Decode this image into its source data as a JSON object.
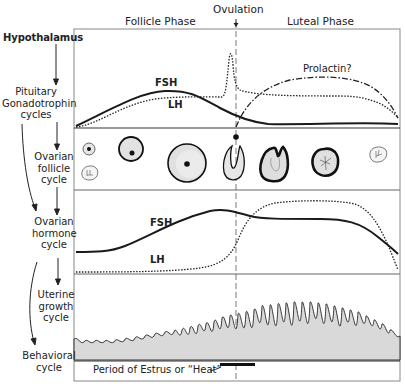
{
  "header": {
    "ovulation": "Ovulation",
    "follicle_phase": "Follicle Phase",
    "luteal_phase": "Luteal Phase"
  },
  "rows": {
    "hypothalamus": "Hypothalamus",
    "pituitary": [
      "Pituitary",
      "Gonadotrophin",
      "cycles"
    ],
    "ovarian_follicle": [
      "Ovarian",
      "follicle",
      "cycle"
    ],
    "ovarian_hormone": [
      "Ovarian",
      "hormone",
      "cycle"
    ],
    "uterine": [
      "Uterine",
      "growth",
      "cycle"
    ],
    "behavioral": [
      "Behavioral",
      "cycle"
    ]
  },
  "curves": {
    "gonadotrophin": {
      "fsh": "FSH",
      "lh": "LH",
      "prolactin": "Prolactin?"
    },
    "hormone": {
      "fsh": "FSH",
      "lh": "LH"
    }
  },
  "behavior": {
    "estrus_label": "Period of Estrus or “Heat”"
  },
  "follicle_stages": [
    "small-follicle",
    "corpus-albicans",
    "growing-follicle",
    "large-follicle",
    "ruptured-follicle",
    "corpus-luteum-forming",
    "corpus-luteum",
    "regressed-corpus"
  ],
  "colors": {
    "ink": "#1a1a1a",
    "frame": "#8a8a8a",
    "shade": "#d9d9d9",
    "paper": "#ffffff"
  }
}
